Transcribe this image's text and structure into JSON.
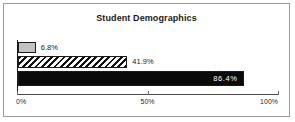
{
  "chart_data": {
    "type": "bar",
    "orientation": "horizontal",
    "title": "Student Demographics",
    "xlabel": "",
    "ylabel": "",
    "xlim": [
      0,
      100
    ],
    "grid": false,
    "legend": false,
    "categories": [
      "series-1",
      "series-2",
      "series-3"
    ],
    "values": [
      6.8,
      41.9,
      86.4
    ],
    "data_labels": [
      "6.8%",
      "41.9%",
      "86.4%"
    ],
    "tick_labels": [
      "0%",
      "50%",
      "100%"
    ],
    "tick_values": [
      0,
      50,
      100
    ],
    "series": [
      {
        "name": "series-1",
        "value": 6.8,
        "label": "6.8%",
        "style": "solid-gray",
        "color": "#c2c2c2",
        "label_position": "outside"
      },
      {
        "name": "series-2",
        "value": 41.9,
        "label": "41.9%",
        "style": "diagonal-hatch",
        "color": "#ffffff",
        "label_position": "outside"
      },
      {
        "name": "series-3",
        "value": 86.4,
        "label": "86.4%",
        "style": "solid-black",
        "color": "#0a0a0a",
        "label_position": "inside"
      }
    ]
  },
  "frame": {
    "border_color": "#9a9a9a",
    "background": "#ffffff"
  }
}
